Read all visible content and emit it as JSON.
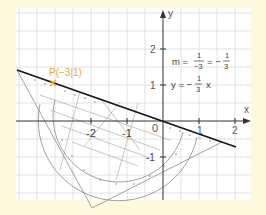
{
  "figure": {
    "background": "#fdf9dc",
    "grid_background": "#ffffff",
    "grid_color": "#d6d6d6",
    "axis": {
      "x_label": "x",
      "y_label": "y",
      "x_ticks": [
        "-2",
        "-1",
        "0",
        "1",
        "2"
      ],
      "y_ticks": [
        "2",
        "1",
        "-1"
      ],
      "origin_label": "0"
    },
    "point": {
      "label": "P(−3|1)",
      "color": "#e8a73a"
    },
    "annotations": {
      "slope_m": "m =",
      "slope_frac1_num": "1",
      "slope_frac1_den": "−3",
      "slope_eq": "= −",
      "slope_frac2_num": "1",
      "slope_frac2_den": "3",
      "line_lhs": "y = −",
      "line_frac_num": "1",
      "line_frac_den": "3",
      "line_var": "x"
    },
    "line_color": "#1a1a1a",
    "set_square_color": "#8a8a8a"
  }
}
